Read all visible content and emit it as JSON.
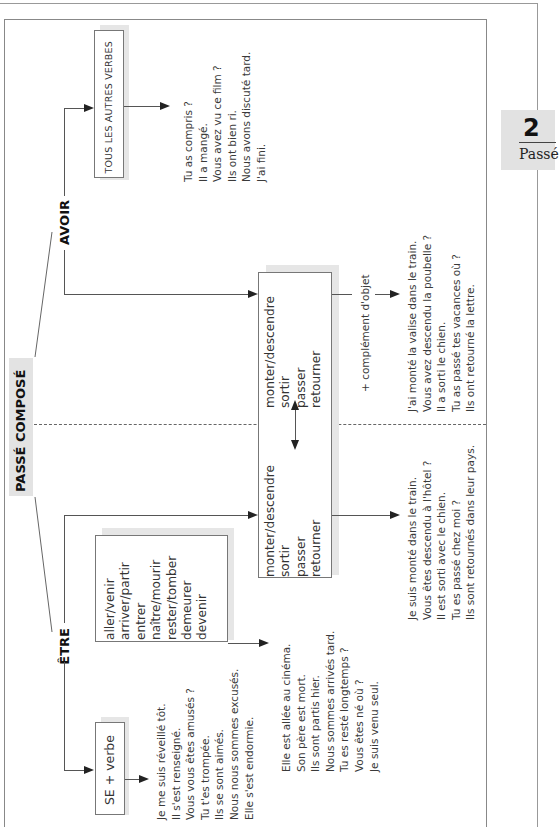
{
  "page": {
    "title": "PASSÉ COMPOSÉ",
    "tab": {
      "number": "2",
      "label": "Passé"
    }
  },
  "branches": {
    "avoir": {
      "label": "AVOIR"
    },
    "etre": {
      "label": "ÊTRE"
    }
  },
  "avoir_section": {
    "other_verbs_box": "TOUS LES AUTRES VERBES",
    "other_verbs_examples": [
      "Tu as compris ?",
      "Il a mangé.",
      "Vous avez vu ce film ?",
      "Ils ont bien ri.",
      "Nous avons discuté tard.",
      "J'ai fini."
    ],
    "movement_verbs_box": [
      "monter/descendre",
      "sortir",
      "passer",
      "retourner"
    ],
    "complement_label": "+ complément d'objet",
    "movement_examples": [
      "J'ai monté la valise dans le train.",
      "Vous avez descendu la poubelle ?",
      "Il a sorti le chien.",
      "Tu as passé tes vacances où ?",
      "Ils ont retourné la lettre."
    ]
  },
  "etre_section": {
    "se_verb_box": "SE + verbe",
    "se_verb_examples": [
      "Je me suis réveillé tôt.",
      "Il s'est renseigné.",
      "Vous vous êtes amusés ?",
      "Tu t'es trompée.",
      "Ils se sont aimés.",
      "Nous nous sommes excusés.",
      "Elle s'est endormie."
    ],
    "motion_verbs_box": [
      "aller/venir",
      "arriver/partir",
      "entrer",
      "naître/mourir",
      "rester/tomber",
      "demeurer",
      "devenir"
    ],
    "motion_verbs_examples": [
      "Elle est allée au cinéma.",
      "Son père est mort.",
      "Ils sont partis hier.",
      "Nous sommes arrivés tard.",
      "Tu es resté longtemps ?",
      "Vous êtes né où ?",
      "Je suis venu seul."
    ],
    "movement_verbs_box": [
      "monter/descendre",
      "sortir",
      "passer",
      "retourner"
    ],
    "movement_examples": [
      "Je suis monté dans le train.",
      "Vous êtes descendu à l'hôtel ?",
      "Il est sorti avec le chien.",
      "Tu es passé chez moi ?",
      "Ils sont retournés dans leur pays."
    ]
  }
}
